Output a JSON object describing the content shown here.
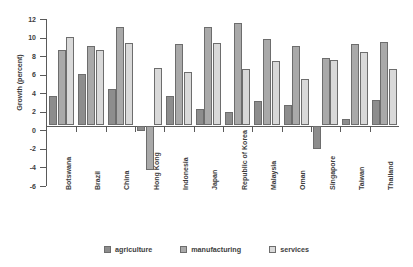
{
  "chart_data": {
    "type": "bar",
    "title": "",
    "xlabel": "",
    "ylabel": "Growth (percent)",
    "ylim": [
      -6,
      12
    ],
    "ytick_step": 2,
    "yticks": [
      12,
      10,
      8,
      6,
      4,
      2,
      0,
      -2,
      -4,
      -6
    ],
    "grid": false,
    "legend_position": "bottom",
    "categories": [
      "Botswana",
      "Brazil",
      "China",
      "Hong Kong",
      "Indonesia",
      "Japan",
      "Republic of Korea",
      "Malaysia",
      "Oman",
      "Singapore",
      "Taiwan",
      "Thailand"
    ],
    "series": [
      {
        "name": "agriculture",
        "color": "#8d8d8d",
        "values": [
          3.1,
          5.5,
          3.9,
          -0.5,
          3.1,
          1.7,
          1.4,
          2.6,
          2.2,
          -2.5,
          0.7,
          2.7
        ]
      },
      {
        "name": "manufacturing",
        "color": "#a9a9a9",
        "values": [
          8.1,
          8.5,
          10.6,
          -4.7,
          8.7,
          10.6,
          11.0,
          9.3,
          8.5,
          7.2,
          8.7,
          9.0
        ]
      },
      {
        "name": "services",
        "color": "#d9d9d9",
        "values": [
          9.5,
          8.1,
          8.8,
          6.1,
          5.7,
          8.8,
          6.0,
          6.9,
          5.0,
          7.0,
          7.9,
          6.0
        ]
      }
    ]
  },
  "legend": {
    "items": [
      {
        "label": "agriculture"
      },
      {
        "label": "manufacturing"
      },
      {
        "label": "services"
      }
    ]
  },
  "axis": {
    "y_title": "Growth (percent)"
  }
}
